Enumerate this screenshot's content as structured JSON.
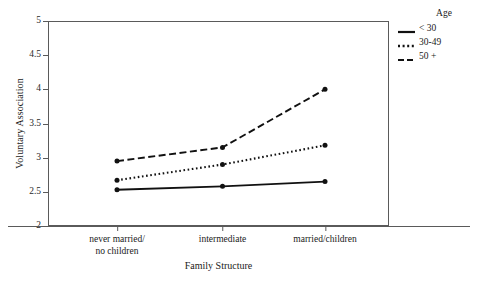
{
  "chart_data": {
    "type": "line",
    "title": "",
    "xlabel": "Family Structure",
    "ylabel": "Voluntary Association",
    "categories": [
      "never married/\nno children",
      "intermediate",
      "married/children"
    ],
    "ylim": [
      2,
      5
    ],
    "yticks": [
      "2",
      "2.5",
      "3",
      "3.5",
      "4",
      "4.5",
      "5"
    ],
    "ytick_values": [
      2,
      2.5,
      3,
      3.5,
      4,
      4.5,
      5
    ],
    "grid": false,
    "legend_position": "right",
    "legend_title": "Age",
    "series": [
      {
        "name": "< 30",
        "line_style": "solid",
        "color": "#111111",
        "values": [
          2.53,
          2.58,
          2.65
        ]
      },
      {
        "name": "30-49",
        "line_style": "dotted",
        "color": "#111111",
        "values": [
          2.67,
          2.9,
          3.18
        ]
      },
      {
        "name": "50 +",
        "line_style": "dashed",
        "color": "#111111",
        "values": [
          2.95,
          3.15,
          4.0
        ]
      }
    ]
  },
  "legend": {
    "title": "Age",
    "entries": [
      {
        "label": "< 30",
        "style": "solid"
      },
      {
        "label": "30-49",
        "style": "dotted"
      },
      {
        "label": "50 +",
        "style": "dashed"
      }
    ]
  },
  "axes": {
    "y_title": "Voluntary Association",
    "x_title": "Family Structure",
    "y_tick_labels": [
      "5",
      "4.5",
      "4",
      "3.5",
      "3",
      "2.5",
      "2"
    ],
    "x_tick_labels": [
      "never married/\nno children",
      "intermediate",
      "married/children"
    ]
  }
}
